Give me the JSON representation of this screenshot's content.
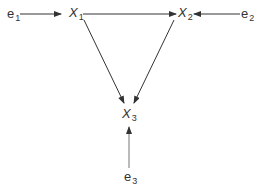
{
  "diagram": {
    "type": "path-diagram",
    "nodes": [
      {
        "id": "e1",
        "var": "e",
        "sub": "1",
        "italic": false
      },
      {
        "id": "X1",
        "var": "X",
        "sub": "1",
        "italic": true
      },
      {
        "id": "X2",
        "var": "X",
        "sub": "2",
        "italic": true
      },
      {
        "id": "e2",
        "var": "e",
        "sub": "2",
        "italic": false
      },
      {
        "id": "X3",
        "var": "X",
        "sub": "3",
        "italic": true
      },
      {
        "id": "e3",
        "var": "e",
        "sub": "3",
        "italic": false
      }
    ],
    "edges": [
      {
        "from": "e1",
        "to": "X1"
      },
      {
        "from": "X1",
        "to": "X2"
      },
      {
        "from": "e2",
        "to": "X2"
      },
      {
        "from": "X1",
        "to": "X3"
      },
      {
        "from": "X2",
        "to": "X3"
      },
      {
        "from": "e3",
        "to": "X3"
      }
    ],
    "colors": {
      "line": "#333333",
      "text": "#333333",
      "background": "#ffffff"
    }
  }
}
